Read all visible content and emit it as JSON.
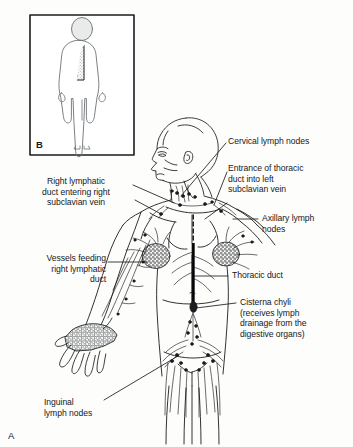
{
  "figure": {
    "main_letter": "A",
    "inset_letter": "B",
    "background_color": "#fdfdfc",
    "ink_color": "#1a1c1e",
    "stipple_color": "#7d8286"
  },
  "labels": {
    "cervical": "Cervical lymph nodes",
    "entrance_thoracic": "Entrance of thoracic\nduct into left\nsubclavian vein",
    "right_lymphatic_duct": "Right lymphatic\nduct entering right\nsubclavian vein",
    "axillary": "Axillary lymph\nnodes",
    "vessels_feeding": "Vessels feeding\nright lymphatic\nduct",
    "thoracic_duct": "Thoracic duct",
    "cisterna_chyli": "Cisterna chyli\n(receives lymph\ndrainage from the\ndigestive organs)",
    "inguinal": "Inguinal\nlymph nodes"
  }
}
